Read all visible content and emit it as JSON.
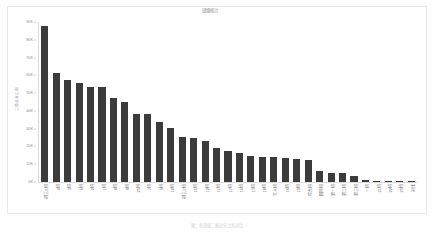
{
  "chart_data": {
    "type": "bar",
    "title": "班级统计",
    "xlabel": "",
    "ylabel": "二模总分之和",
    "ylim": [
      0,
      90000
    ],
    "grid": false,
    "legend": null,
    "y_ticks": [
      {
        "value": 0,
        "label": "0K"
      },
      {
        "value": 10000,
        "label": "10K"
      },
      {
        "value": 20000,
        "label": "20K"
      },
      {
        "value": 30000,
        "label": "30K"
      },
      {
        "value": 40000,
        "label": "40K"
      },
      {
        "value": 50000,
        "label": "50K"
      },
      {
        "value": 60000,
        "label": "60K"
      },
      {
        "value": 70000,
        "label": "70K"
      },
      {
        "value": 80000,
        "label": "80K"
      },
      {
        "value": 90000,
        "label": "90K"
      }
    ],
    "categories": [
      "初三/1班",
      "4班",
      "3班",
      "6班",
      "2班",
      "1班",
      "8班",
      "8班",
      "25班",
      "7班",
      "9班",
      "10班",
      "初三/7班",
      "15班",
      "12班",
      "11班",
      "17班",
      "14班",
      "13班",
      "18班",
      "艺人班",
      "16班",
      "19班",
      "综合班",
      "国际班",
      "第一班",
      "第二班",
      "第三班",
      "一班",
      "21班",
      "22班",
      "23班",
      "对比"
    ],
    "values": [
      88000,
      61500,
      57500,
      55500,
      53500,
      53200,
      47500,
      45000,
      38500,
      38000,
      34000,
      30500,
      25500,
      25000,
      23000,
      19000,
      17500,
      16500,
      14500,
      14200,
      13800,
      13600,
      13200,
      12500,
      6000,
      5000,
      4800,
      3200,
      1200,
      600,
      300,
      200,
      100
    ],
    "bar_color": "#3b3b3b",
    "background_color": "#ffffff",
    "axis_color": "#d9d9d9"
  },
  "caption": "图：各班级二模总分之和对比",
  "colors": {
    "bar": "#3b3b3b",
    "tick_text": "#8d8d8d",
    "title_text": "#8a8a8a",
    "caption_text": "#d2d2d2",
    "card_border": "#e8e8e8"
  }
}
